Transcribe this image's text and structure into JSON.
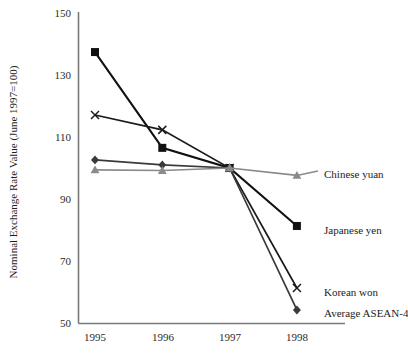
{
  "chart_data": {
    "type": "line",
    "title": "",
    "xlabel": "",
    "ylabel": "Nominal Exchange Rate Value (June 1997=100)",
    "categories": [
      "1995",
      "1996",
      "1997",
      "1998"
    ],
    "x": [
      1995,
      1996,
      1997,
      1998
    ],
    "xlim": [
      1994.6,
      1998.55
    ],
    "ylim": [
      50,
      150
    ],
    "y_ticks": [
      50,
      70,
      90,
      110,
      130,
      150
    ],
    "x_ticks": [
      "1995",
      "1996",
      "1997",
      "1998"
    ],
    "grid": false,
    "legend_position": "right-inline-labels",
    "series": [
      {
        "name": "Japanese yen",
        "marker": "square",
        "color": "#111111",
        "line_width": 2.1,
        "values": [
          137.4,
          106.5,
          100.0,
          81.3
        ]
      },
      {
        "name": "Korean won",
        "marker": "x-cross",
        "color": "#1a1a1a",
        "line_width": 1.7,
        "values": [
          117.1,
          112.3,
          100.0,
          61.3
        ]
      },
      {
        "name": "Average ASEAN-4",
        "marker": "diamond",
        "color": "#3a3a3a",
        "line_width": 1.7,
        "values": [
          102.6,
          101.0,
          100.0,
          54.2
        ]
      },
      {
        "name": "Chinese yuan",
        "marker": "triangle",
        "color": "#8a8a8a",
        "line_width": 1.7,
        "values": [
          99.4,
          99.2,
          100.0,
          97.6
        ]
      }
    ],
    "annotations": [
      {
        "text": "Chinese yuan",
        "x": 1998,
        "y": 97.6
      },
      {
        "text": "Japanese yen",
        "x": 1998,
        "y": 81.3
      },
      {
        "text": "Korean won",
        "x": 1998,
        "y": 61.3
      },
      {
        "text": "Average ASEAN-4",
        "x": 1998,
        "y": 54.2
      }
    ]
  },
  "axes": {
    "y_title": "Nominal Exchange Rate Value (June 1997=100)",
    "y_tick_labels": [
      "150",
      "130",
      "110",
      "90",
      "70",
      "50"
    ],
    "x_tick_labels": [
      "1995",
      "1996",
      "1997",
      "1998"
    ]
  },
  "labels": {
    "chinese_yuan": "Chinese yuan",
    "japanese_yen": "Japanese yen",
    "korean_won": "Korean won",
    "average_asean_4": "Average ASEAN-4"
  },
  "colors": {
    "axis": "#7a7a7a",
    "yen": "#111111",
    "won": "#1a1a1a",
    "asean": "#3a3a3a",
    "yuan": "#8a8a8a",
    "text": "#1c1c1c",
    "background": "#ffffff"
  }
}
